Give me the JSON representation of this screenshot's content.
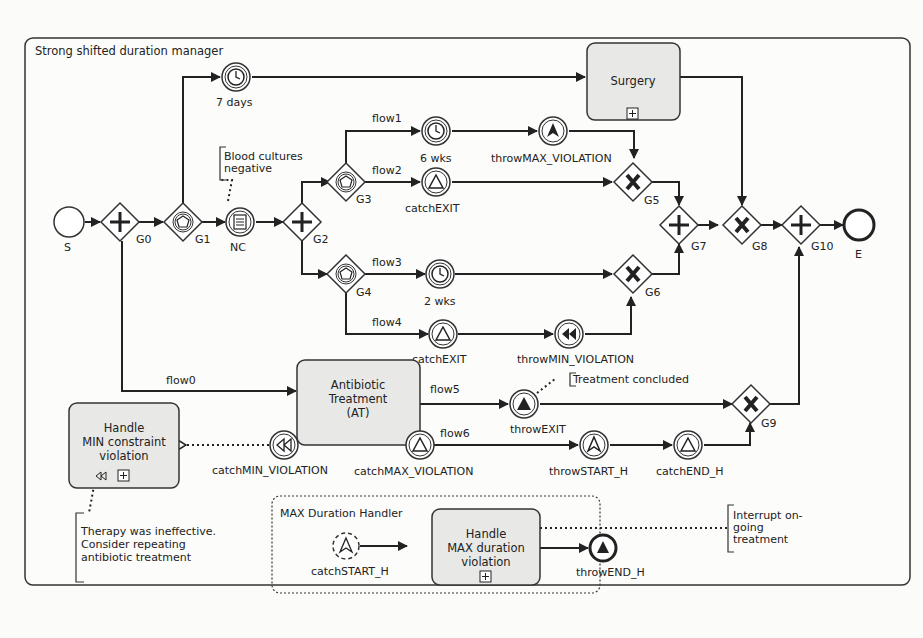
{
  "pool": {
    "title": "Strong shifted duration manager"
  },
  "start_event": {
    "label": "S"
  },
  "end_event": {
    "label": "E"
  },
  "gateways": {
    "G0": {
      "label": "G0",
      "type": "parallel"
    },
    "G1": {
      "label": "G1",
      "type": "event-based"
    },
    "G2": {
      "label": "G2",
      "type": "parallel"
    },
    "G3": {
      "label": "G3",
      "type": "event-based"
    },
    "G4": {
      "label": "G4",
      "type": "event-based"
    },
    "G5": {
      "label": "G5",
      "type": "exclusive"
    },
    "G6": {
      "label": "G6",
      "type": "exclusive"
    },
    "G7": {
      "label": "G7",
      "type": "parallel"
    },
    "G8": {
      "label": "G8",
      "type": "exclusive"
    },
    "G9": {
      "label": "G9",
      "type": "exclusive"
    },
    "G10": {
      "label": "G10",
      "type": "parallel"
    }
  },
  "events": {
    "timer7": {
      "label": "7 days",
      "icon": "clock-icon"
    },
    "nc": {
      "label": "NC",
      "icon": "conditional-icon"
    },
    "timer6": {
      "label": "6 wks",
      "icon": "clock-icon"
    },
    "throwMax": {
      "label": "throwMAX_VIOLATION",
      "icon": "escalation-filled-icon"
    },
    "catchExit1": {
      "label": "catchEXIT",
      "icon": "signal-icon"
    },
    "timer2": {
      "label": "2 wks",
      "icon": "clock-icon"
    },
    "catchExit2": {
      "label": "catchEXIT",
      "icon": "signal-icon"
    },
    "throwMin": {
      "label": "throwMIN_VIOLATION",
      "icon": "compensation-filled-icon"
    },
    "catchMin": {
      "label": "catchMIN_VIOLATION",
      "icon": "compensation-icon"
    },
    "catchMax": {
      "label": "catchMAX_VIOLATION",
      "icon": "signal-icon"
    },
    "throwExit": {
      "label": "throwEXIT",
      "icon": "signal-filled-icon"
    },
    "throwStartH": {
      "label": "throwSTART_H",
      "icon": "escalation-icon"
    },
    "catchEndH": {
      "label": "catchEND_H",
      "icon": "signal-icon"
    },
    "catchStartH": {
      "label": "catchSTART_H",
      "icon": "escalation-icon"
    },
    "throwEndH": {
      "label": "throwEND_H",
      "icon": "signal-filled-icon"
    }
  },
  "flows": {
    "flow0": "flow0",
    "flow1": "flow1",
    "flow2": "flow2",
    "flow3": "flow3",
    "flow4": "flow4",
    "flow5": "flow5",
    "flow6": "flow6"
  },
  "tasks": {
    "surgery": {
      "lines": [
        "Surgery"
      ]
    },
    "antibiotic": {
      "lines": [
        "Antibiotic",
        "Treatment",
        "(AT)"
      ]
    },
    "handleMin": {
      "lines": [
        "Handle",
        "MIN constraint",
        "violation"
      ]
    },
    "handleMax": {
      "lines": [
        "Handle",
        "MAX duration",
        "violation"
      ]
    }
  },
  "subprocess": {
    "title": "MAX Duration Handler"
  },
  "annotations": {
    "blood": {
      "lines": [
        "Blood cultures",
        "negative"
      ]
    },
    "concluded": {
      "lines": [
        "Treatment concluded"
      ]
    },
    "therapy": {
      "lines": [
        "Therapy was ineffective.",
        "Consider repeating",
        "antibiotic treatment"
      ]
    },
    "interrupt": {
      "lines": [
        "Interrupt on-",
        "going",
        "treatment"
      ]
    }
  }
}
